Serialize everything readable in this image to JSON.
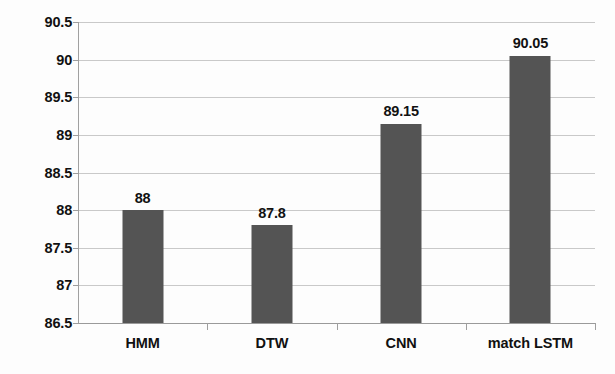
{
  "chart_data": {
    "type": "bar",
    "title": "",
    "subtitle": "",
    "xlabel": "",
    "ylabel": "",
    "categories": [
      "HMM",
      "DTW",
      "CNN",
      "match LSTM"
    ],
    "values": [
      88,
      87.8,
      89.15,
      90.05
    ],
    "value_labels": [
      "88",
      "87.8",
      "89.15",
      "90.05"
    ],
    "ylim": [
      86.5,
      90.5
    ],
    "yticks": [
      86.5,
      87,
      87.5,
      88,
      88.5,
      89,
      89.5,
      90,
      90.5
    ],
    "ytick_labels": [
      "86.5",
      "87",
      "87.5",
      "88",
      "88.5",
      "89",
      "89.5",
      "90",
      "90.5"
    ],
    "grid": true,
    "legend": null,
    "legend_position": "none",
    "series": [
      {
        "name": "accuracy",
        "values": [
          88,
          87.8,
          89.15,
          90.05
        ]
      }
    ],
    "colors": {
      "bar_fill": "#545454",
      "gridline": "#c9c9c9",
      "axis": "#9e9e9e",
      "text": "#111111",
      "background": "#fdfdfd"
    }
  }
}
